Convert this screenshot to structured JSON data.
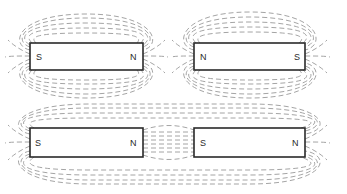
{
  "diagram": {
    "type": "magnetic field lines of bar magnets",
    "panels": [
      {
        "name": "top-left",
        "magnets": [
          {
            "left_pole": "S",
            "right_pole": "N"
          }
        ]
      },
      {
        "name": "top-right",
        "magnets": [
          {
            "left_pole": "N",
            "right_pole": "S"
          }
        ]
      },
      {
        "name": "bottom",
        "description": "two magnets aligned end to end, N facing S (attraction)",
        "magnets": [
          {
            "left_pole": "S",
            "right_pole": "N"
          },
          {
            "left_pole": "S",
            "right_pole": "N"
          }
        ]
      }
    ],
    "colors": {
      "field_line": "#9a9a9a",
      "magnet_outline": "#2a2a2a",
      "background": "#ffffff"
    }
  }
}
